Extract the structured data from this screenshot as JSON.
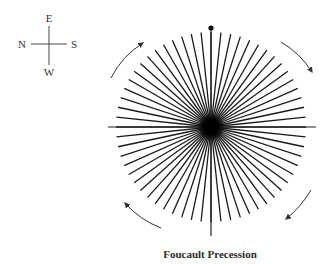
{
  "compass": {
    "top": "E",
    "left": "N",
    "right": "S",
    "bottom": "W",
    "center": [
      49,
      44
    ]
  },
  "star": {
    "center": [
      211,
      127
    ],
    "ray_count": 60,
    "ray_length": 95,
    "horizontal_extent": [
      108,
      316
    ],
    "vertical_extent": [
      28,
      236
    ],
    "top_marker": "dot",
    "ray_color": "#1a1a1a",
    "center_color": "#000000"
  },
  "arrows": [
    {
      "name": "top-left",
      "direction": "clockwise"
    },
    {
      "name": "top-right",
      "direction": "clockwise"
    },
    {
      "name": "bottom-right",
      "direction": "clockwise"
    },
    {
      "name": "bottom-left",
      "direction": "clockwise"
    }
  ],
  "caption": "Foucault Precession"
}
